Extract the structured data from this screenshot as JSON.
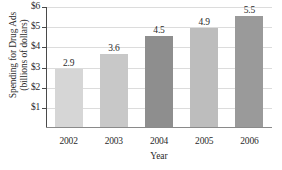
{
  "chart_data": {
    "type": "bar",
    "title": "",
    "xlabel": "Year",
    "ylabel": "Spending for Drug Ads (billions of dollars)",
    "ylabel_lines": [
      "Spending for Drug Ads",
      "(billions of dollars)"
    ],
    "categories": [
      "2002",
      "2003",
      "2004",
      "2005",
      "2006"
    ],
    "values": [
      2.9,
      3.6,
      4.5,
      4.9,
      5.5
    ],
    "value_labels": [
      "2.9",
      "3.6",
      "4.5",
      "4.9",
      "5.5"
    ],
    "bar_colors": [
      "#d6d6d6",
      "#c8c8c8",
      "#8e8e8e",
      "#bdbdbd",
      "#9a9a9a"
    ],
    "ylim": [
      0,
      6
    ],
    "y_ticks": [
      1,
      2,
      3,
      4,
      5,
      6
    ],
    "y_tick_labels": [
      "$1",
      "$2",
      "$3",
      "$4",
      "$5",
      "$6"
    ],
    "grid": true,
    "legend": "none",
    "axis_color": "#4a4a4a",
    "grid_color": "#dcdcdc",
    "text_color": "#2b2b2b"
  }
}
